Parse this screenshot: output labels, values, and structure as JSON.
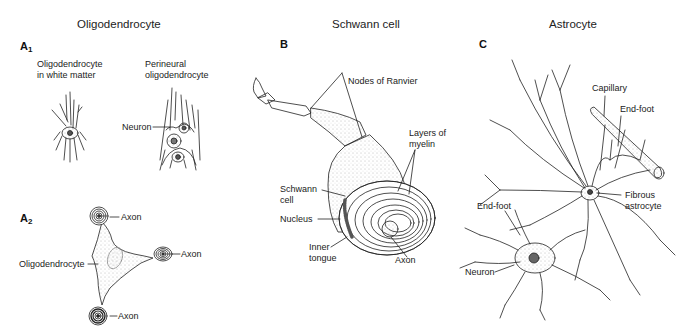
{
  "figure": {
    "columns": [
      {
        "title": "Oligodendrocyte",
        "panels": [
          "A1",
          "A2"
        ]
      },
      {
        "title": "Schwann cell",
        "panels": [
          "B"
        ]
      },
      {
        "title": "Astrocyte",
        "panels": [
          "C"
        ]
      }
    ]
  },
  "panel_a1": {
    "letter": "A",
    "sub": "1",
    "left_caption_line1": "Oligodendrocyte",
    "left_caption_line2": "in white matter",
    "right_caption_line1": "Perineural",
    "right_caption_line2": "oligodendrocyte",
    "neuron_label": "Neuron"
  },
  "panel_a2": {
    "letter": "A",
    "sub": "2",
    "axon_top": "Axon",
    "axon_right": "Axon",
    "axon_bottom": "Axon",
    "cell_label": "Oligodendrocyte"
  },
  "panel_b": {
    "letter": "B",
    "nodes_label": "Nodes of Ranvier",
    "myelin_line1": "Layers of",
    "myelin_line2": "myelin",
    "schwann_line1": "Schwann",
    "schwann_line2": "cell",
    "nucleus_label": "Nucleus",
    "inner_line1": "Inner",
    "inner_line2": "tongue",
    "axon_label": "Axon"
  },
  "panel_c": {
    "letter": "C",
    "capillary_label": "Capillary",
    "endfoot_top": "End-foot",
    "endfoot_left": "End-foot",
    "fibrous_line1": "Fibrous",
    "fibrous_line2": "astrocyte",
    "neuron_label": "Neuron"
  }
}
